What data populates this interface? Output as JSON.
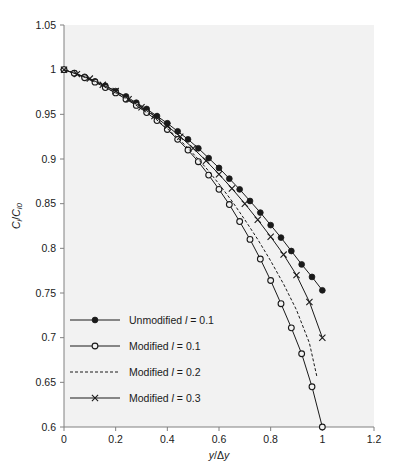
{
  "chart_data": {
    "type": "line",
    "title": "",
    "xlabel": "y/Δy",
    "ylabel": "Cᵢ/Cᵢ0",
    "xlim": [
      0,
      1.2
    ],
    "ylim": [
      0.6,
      1.05
    ],
    "xticks": [
      "0",
      "0.2",
      "0.4",
      "0.6",
      "0.8",
      "1",
      "1.2"
    ],
    "xtick_values": [
      0,
      0.2,
      0.4,
      0.6,
      0.8,
      1.0,
      1.2
    ],
    "yticks": [
      "0.6",
      "0.65",
      "0.7",
      "0.75",
      "0.8",
      "0.85",
      "0.9",
      "0.95",
      "1",
      "1.05"
    ],
    "ytick_values": [
      0.6,
      0.65,
      0.7,
      0.75,
      0.8,
      0.85,
      0.9,
      0.95,
      1.0,
      1.05
    ],
    "grid": false,
    "legend_position": "lower-left-inside",
    "plot_background": "#f2f2f2",
    "line_color": "#1a1a1a",
    "series": [
      {
        "name": "Unmodified l = 0.1",
        "marker": "filled-circle",
        "linestyle": "solid",
        "x": [
          0,
          0.04,
          0.08,
          0.12,
          0.16,
          0.2,
          0.24,
          0.28,
          0.32,
          0.36,
          0.4,
          0.44,
          0.48,
          0.52,
          0.56,
          0.6,
          0.64,
          0.68,
          0.72,
          0.76,
          0.8,
          0.84,
          0.88,
          0.92,
          0.96,
          1.0
        ],
        "y": [
          1.0,
          0.996,
          0.992,
          0.987,
          0.982,
          0.976,
          0.97,
          0.963,
          0.956,
          0.948,
          0.94,
          0.931,
          0.922,
          0.912,
          0.901,
          0.89,
          0.878,
          0.866,
          0.853,
          0.84,
          0.826,
          0.812,
          0.797,
          0.782,
          0.768,
          0.753
        ]
      },
      {
        "name": "Modified l = 0.1",
        "marker": "open-circle",
        "linestyle": "solid",
        "x": [
          0,
          0.04,
          0.08,
          0.12,
          0.16,
          0.2,
          0.24,
          0.28,
          0.32,
          0.36,
          0.4,
          0.44,
          0.48,
          0.52,
          0.56,
          0.6,
          0.64,
          0.68,
          0.72,
          0.76,
          0.8,
          0.84,
          0.88,
          0.92,
          0.96,
          1.0
        ],
        "y": [
          1.0,
          0.996,
          0.991,
          0.986,
          0.98,
          0.974,
          0.967,
          0.96,
          0.952,
          0.943,
          0.933,
          0.922,
          0.91,
          0.897,
          0.882,
          0.866,
          0.849,
          0.83,
          0.81,
          0.788,
          0.764,
          0.738,
          0.711,
          0.682,
          0.645,
          0.6
        ]
      },
      {
        "name": "Modified l = 0.2",
        "marker": "none",
        "linestyle": "dashed",
        "x": [
          0,
          0.05,
          0.1,
          0.15,
          0.2,
          0.25,
          0.3,
          0.35,
          0.4,
          0.45,
          0.5,
          0.55,
          0.6,
          0.65,
          0.7,
          0.75,
          0.8,
          0.85,
          0.9,
          0.95,
          0.98
        ],
        "y": [
          1.0,
          0.995,
          0.989,
          0.982,
          0.974,
          0.966,
          0.956,
          0.946,
          0.934,
          0.921,
          0.906,
          0.89,
          0.872,
          0.853,
          0.832,
          0.81,
          0.786,
          0.76,
          0.731,
          0.694,
          0.655
        ]
      },
      {
        "name": "Modified l = 0.3",
        "marker": "cross",
        "linestyle": "solid",
        "x": [
          0,
          0.05,
          0.1,
          0.15,
          0.2,
          0.25,
          0.3,
          0.35,
          0.4,
          0.45,
          0.5,
          0.55,
          0.6,
          0.65,
          0.7,
          0.75,
          0.8,
          0.85,
          0.9,
          0.95,
          1.0
        ],
        "y": [
          1.0,
          0.995,
          0.99,
          0.983,
          0.976,
          0.967,
          0.958,
          0.948,
          0.937,
          0.925,
          0.912,
          0.898,
          0.883,
          0.867,
          0.85,
          0.832,
          0.813,
          0.793,
          0.77,
          0.74,
          0.7
        ]
      }
    ]
  },
  "legend": {
    "items": [
      {
        "label": "Unmodified l = 0.1",
        "prefix": "Unmodified ",
        "symbol": "l",
        "suffix": " = 0.1"
      },
      {
        "label": "Modified l = 0.1",
        "prefix": "Modified ",
        "symbol": "l",
        "suffix": " = 0.1"
      },
      {
        "label": "Modified l = 0.2",
        "prefix": "Modified ",
        "symbol": "l",
        "suffix": " = 0.2"
      },
      {
        "label": "Modified l = 0.3",
        "prefix": "Modified ",
        "symbol": "l",
        "suffix": " = 0.3"
      }
    ]
  },
  "axis_labels": {
    "x_parts": {
      "y1": "y",
      "slash": "/",
      "delta": "Δ",
      "y2": "y"
    },
    "y_parts": {
      "c1": "C",
      "sub1": "i",
      "slash": "/",
      "c2": "C",
      "sub2": "i0"
    }
  }
}
